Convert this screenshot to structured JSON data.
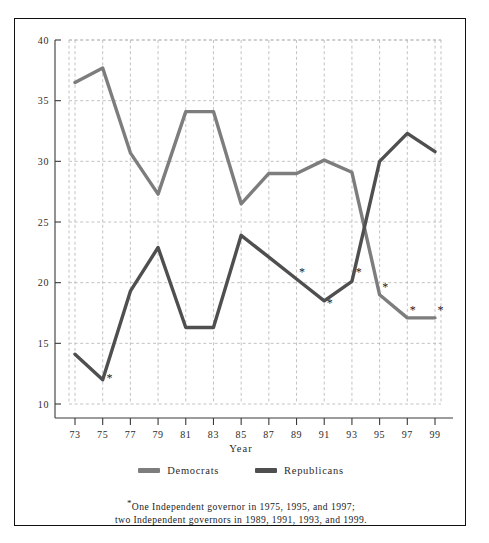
{
  "chart_data": {
    "type": "line",
    "title": "",
    "xlabel": "Year",
    "ylabel": "",
    "categories": [
      "73",
      "75",
      "77",
      "79",
      "81",
      "83",
      "85",
      "87",
      "89",
      "91",
      "93",
      "95",
      "97",
      "99"
    ],
    "x": [
      73,
      75,
      77,
      79,
      81,
      83,
      85,
      87,
      89,
      91,
      93,
      95,
      97,
      99
    ],
    "xlim": [
      72,
      100
    ],
    "ylim": [
      10,
      40
    ],
    "yticks": [
      10,
      15,
      20,
      25,
      30,
      35,
      40
    ],
    "xticks": [
      73,
      75,
      77,
      79,
      81,
      83,
      85,
      87,
      89,
      91,
      93,
      95,
      97,
      99
    ],
    "grid": true,
    "legend_position": "bottom",
    "series": [
      {
        "name": "Democrats",
        "color": "#7d7d7d",
        "values": [
          36.5,
          37.7,
          30.7,
          27.3,
          34.1,
          34.1,
          26.5,
          29.0,
          29.0,
          30.1,
          29.1,
          19.0,
          17.1,
          17.1
        ]
      },
      {
        "name": "Republicans",
        "color": "#4f4f4f",
        "values": [
          14.1,
          12.0,
          19.3,
          22.9,
          16.3,
          16.3,
          23.9,
          22.1,
          20.3,
          18.5,
          20.1,
          30.0,
          32.3,
          30.8
        ]
      }
    ],
    "annotations": [
      {
        "label": "*",
        "x": 75.5,
        "y": 12.1
      },
      {
        "label": "*",
        "x": 89.4,
        "y": 20.8
      },
      {
        "label": "*",
        "x": 91.4,
        "y": 18.3
      },
      {
        "label": "*",
        "x": 93.5,
        "y": 20.8
      },
      {
        "label": "*",
        "x": 95.4,
        "y": 19.6
      },
      {
        "label": "*",
        "x": 97.4,
        "y": 17.7
      },
      {
        "label": "*",
        "x": 99.4,
        "y": 17.7
      }
    ]
  },
  "axis": {
    "x_title": "Year",
    "y_tick_labels": [
      "40",
      "35",
      "30",
      "25",
      "20",
      "15",
      "10"
    ],
    "x_tick_labels": [
      "73",
      "75",
      "77",
      "79",
      "81",
      "83",
      "85",
      "87",
      "89",
      "91",
      "93",
      "95",
      "97",
      "99"
    ]
  },
  "legend": {
    "items": [
      {
        "label": "Democrats",
        "color": "#7d7d7d"
      },
      {
        "label": "Republicans",
        "color": "#4f4f4f"
      }
    ]
  },
  "footnote": {
    "marker": "*",
    "line1": "One Independent governor in 1975, 1995, and 1997;",
    "line2": "two Independent governors in 1989, 1991, 1993, and 1999."
  },
  "colors": {
    "democrats": "#7d7d7d",
    "republicans": "#4f4f4f",
    "grid": "#b4b4b4",
    "axis": "#3a3a3a",
    "frame": "#111111"
  }
}
